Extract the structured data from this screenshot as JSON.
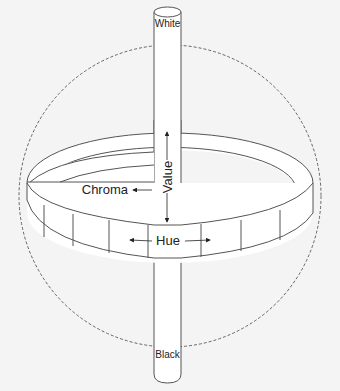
{
  "diagram": {
    "labels": {
      "white": "White",
      "black": "Black",
      "value": "Value",
      "chroma": "Chroma",
      "hue": "Hue"
    },
    "colors": {
      "background": "#f4f4f4",
      "stroke": "#555555",
      "fill": "#ffffff",
      "text": "#222222"
    }
  }
}
